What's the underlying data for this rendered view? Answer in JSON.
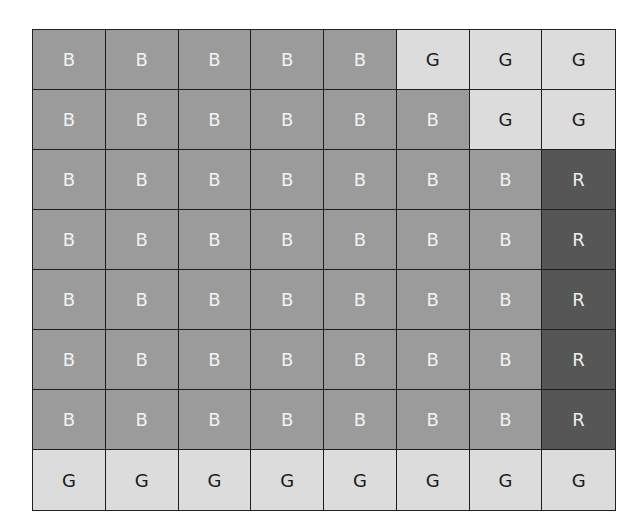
{
  "grid": {
    "rows": 8,
    "cols": 8,
    "colors": {
      "B": "#9b9b9b",
      "G": "#dcdcdc",
      "R": "#565656"
    },
    "cells": [
      [
        "B",
        "B",
        "B",
        "B",
        "B",
        "G",
        "G",
        "G"
      ],
      [
        "B",
        "B",
        "B",
        "B",
        "B",
        "B",
        "G",
        "G"
      ],
      [
        "B",
        "B",
        "B",
        "B",
        "B",
        "B",
        "B",
        "R"
      ],
      [
        "B",
        "B",
        "B",
        "B",
        "B",
        "B",
        "B",
        "R"
      ],
      [
        "B",
        "B",
        "B",
        "B",
        "B",
        "B",
        "B",
        "R"
      ],
      [
        "B",
        "B",
        "B",
        "B",
        "B",
        "B",
        "B",
        "R"
      ],
      [
        "B",
        "B",
        "B",
        "B",
        "B",
        "B",
        "B",
        "R"
      ],
      [
        "G",
        "G",
        "G",
        "G",
        "G",
        "G",
        "G",
        "G"
      ]
    ]
  }
}
